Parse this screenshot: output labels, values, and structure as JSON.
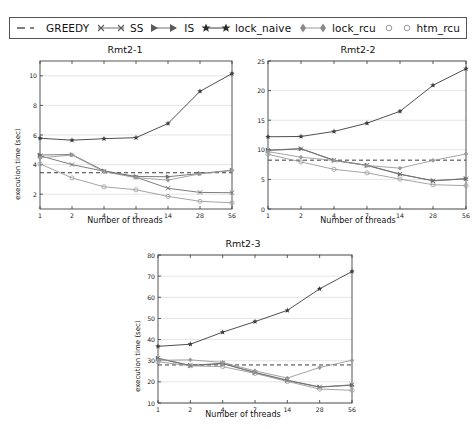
{
  "legend": {
    "entries": [
      {
        "label": "GREEDY",
        "marker": "none",
        "linestyle": "dashed",
        "color": "#3b3b3b"
      },
      {
        "label": "SS",
        "marker": "x",
        "linestyle": "solid",
        "color": "#6e6e6e"
      },
      {
        "label": "IS",
        "marker": "triangle-right",
        "linestyle": "solid",
        "color": "#6e6e6e"
      },
      {
        "label": "lock_naive",
        "marker": "star",
        "linestyle": "solid",
        "color": "#3b3b3b"
      },
      {
        "label": "lock_rcu",
        "marker": "diamond",
        "linestyle": "solid",
        "color": "#9a9a9a"
      },
      {
        "label": "htm_rcu",
        "marker": "circle",
        "linestyle": "solid",
        "color": "#9a9a9a"
      }
    ]
  },
  "chart_data": [
    {
      "type": "line",
      "title": "Rmt2-1",
      "xlabel": "Number of threads",
      "ylabel": "execution time (sec)",
      "categories": [
        "1",
        "2",
        "4",
        "7",
        "14",
        "28",
        "56"
      ],
      "x": [
        1,
        2,
        4,
        7,
        14,
        28,
        56
      ],
      "xticklabels": [
        "1",
        "2",
        "4",
        "7",
        "14",
        "28",
        "56"
      ],
      "yticks": [
        2,
        4,
        6,
        8,
        10
      ],
      "yticklabels": [
        "2",
        "4",
        "6",
        "8",
        "10"
      ],
      "ylim": [
        1.0,
        11.0
      ],
      "grid": true,
      "legend_position": "figure-top",
      "series": [
        {
          "name": "GREEDY",
          "marker": "none",
          "linestyle": "dashed",
          "values": [
            3.45,
            3.45,
            3.45,
            3.45,
            3.45,
            3.45,
            3.45
          ]
        },
        {
          "name": "SS",
          "marker": "x",
          "linestyle": "solid",
          "values": [
            4.6,
            4.0,
            3.55,
            3.15,
            2.4,
            2.12,
            2.1
          ]
        },
        {
          "name": "IS",
          "marker": "triangle-right",
          "linestyle": "solid",
          "values": [
            4.65,
            4.68,
            3.58,
            3.2,
            3.18,
            3.4,
            3.62
          ]
        },
        {
          "name": "lock_naive",
          "marker": "star",
          "linestyle": "solid",
          "values": [
            5.78,
            5.65,
            5.75,
            5.82,
            6.78,
            8.95,
            10.15
          ]
        },
        {
          "name": "lock_rcu",
          "marker": "diamond",
          "linestyle": "solid",
          "values": [
            4.45,
            4.65,
            3.52,
            3.12,
            2.95,
            3.38,
            3.6
          ]
        },
        {
          "name": "htm_rcu",
          "marker": "circle",
          "linestyle": "solid",
          "values": [
            4.05,
            3.1,
            2.5,
            2.3,
            1.85,
            1.52,
            1.42
          ]
        }
      ]
    },
    {
      "type": "line",
      "title": "Rmt2-2",
      "xlabel": "Number of threads",
      "ylabel": "",
      "categories": [
        "1",
        "2",
        "4",
        "7",
        "14",
        "28",
        "56"
      ],
      "x": [
        1,
        2,
        4,
        7,
        14,
        28,
        56
      ],
      "xticklabels": [
        "1",
        "2",
        "4",
        "7",
        "14",
        "28",
        "56"
      ],
      "yticks": [
        0,
        5,
        10,
        15,
        20,
        25
      ],
      "yticklabels": [
        "0",
        "5",
        "10",
        "15",
        "20",
        "25"
      ],
      "ylim": [
        0,
        25
      ],
      "grid": true,
      "legend_position": "figure-top",
      "series": [
        {
          "name": "GREEDY",
          "marker": "none",
          "linestyle": "dashed",
          "values": [
            8.25,
            8.25,
            8.25,
            8.25,
            8.25,
            8.25,
            8.25
          ]
        },
        {
          "name": "SS",
          "marker": "x",
          "linestyle": "solid",
          "values": [
            9.95,
            10.2,
            8.25,
            7.4,
            5.9,
            4.75,
            5.1
          ]
        },
        {
          "name": "IS",
          "marker": "triangle-right",
          "linestyle": "solid",
          "values": [
            9.9,
            10.15,
            8.2,
            7.35,
            5.85,
            4.8,
            5.12
          ]
        },
        {
          "name": "lock_naive",
          "marker": "star",
          "linestyle": "solid",
          "values": [
            12.2,
            12.25,
            13.1,
            14.5,
            16.5,
            20.9,
            23.7
          ]
        },
        {
          "name": "lock_rcu",
          "marker": "diamond",
          "linestyle": "solid",
          "values": [
            9.7,
            8.75,
            8.2,
            7.35,
            6.9,
            8.2,
            9.3
          ]
        },
        {
          "name": "htm_rcu",
          "marker": "circle",
          "linestyle": "solid",
          "values": [
            9.25,
            7.95,
            6.7,
            6.1,
            5.05,
            4.1,
            3.95
          ]
        }
      ]
    },
    {
      "type": "line",
      "title": "Rmt2-3",
      "xlabel": "Number of threads",
      "ylabel": "execution time (sec)",
      "categories": [
        "1",
        "2",
        "4",
        "7",
        "14",
        "28",
        "56"
      ],
      "x": [
        1,
        2,
        4,
        7,
        14,
        28,
        56
      ],
      "xticklabels": [
        "1",
        "2",
        "4",
        "7",
        "14",
        "28",
        "56"
      ],
      "yticks": [
        10,
        20,
        30,
        40,
        50,
        60,
        70,
        80
      ],
      "yticklabels": [
        "10",
        "20",
        "30",
        "40",
        "50",
        "60",
        "70",
        "80"
      ],
      "ylim": [
        10,
        80
      ],
      "grid": true,
      "legend_position": "figure-top",
      "series": [
        {
          "name": "GREEDY",
          "marker": "none",
          "linestyle": "dashed",
          "values": [
            28.0,
            28.0,
            28.0,
            28.0,
            28.0,
            28.0,
            28.0
          ]
        },
        {
          "name": "SS",
          "marker": "x",
          "linestyle": "solid",
          "values": [
            31.2,
            27.8,
            28.8,
            24.5,
            20.8,
            17.6,
            18.6
          ]
        },
        {
          "name": "IS",
          "marker": "triangle-right",
          "linestyle": "solid",
          "values": [
            31.0,
            27.7,
            28.6,
            24.3,
            20.6,
            17.5,
            18.4
          ]
        },
        {
          "name": "lock_naive",
          "marker": "star",
          "linestyle": "solid",
          "values": [
            36.8,
            37.8,
            43.5,
            48.5,
            53.8,
            64.0,
            72.2
          ]
        },
        {
          "name": "lock_rcu",
          "marker": "diamond",
          "linestyle": "solid",
          "values": [
            30.2,
            30.4,
            29.2,
            25.2,
            21.8,
            26.8,
            30.2
          ]
        },
        {
          "name": "htm_rcu",
          "marker": "circle",
          "linestyle": "solid",
          "values": [
            29.5,
            27.6,
            27.2,
            24.0,
            20.2,
            16.6,
            16.0
          ]
        }
      ]
    }
  ]
}
